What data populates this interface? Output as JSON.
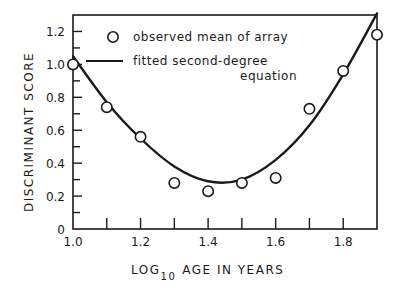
{
  "chart_data": {
    "type": "scatter",
    "title": "",
    "xlabel": "LOG10 AGE IN YEARS",
    "xlabel_parts": {
      "prefix": "LOG",
      "subscript": "10",
      "suffix": "AGE IN YEARS"
    },
    "ylabel": "DISCRIMINANT SCORE",
    "xlim": [
      1.0,
      1.9
    ],
    "ylim": [
      0,
      1.3
    ],
    "x_ticks": [
      1.0,
      1.1,
      1.2,
      1.3,
      1.4,
      1.5,
      1.6,
      1.7,
      1.8
    ],
    "x_tick_labels": [
      "1.0",
      "",
      "1.2",
      "",
      "1.4",
      "",
      "1.6",
      "",
      "1.8"
    ],
    "y_ticks": [
      0,
      0.1,
      0.2,
      0.3,
      0.4,
      0.5,
      0.6,
      0.7,
      0.8,
      0.9,
      1.0,
      1.1,
      1.2
    ],
    "y_tick_labels": [
      "0",
      "",
      "0.2",
      "",
      "0.4",
      "",
      "0.6",
      "",
      "0.8",
      "",
      "1.0",
      "",
      "1.2"
    ],
    "grid": false,
    "legend_position": "upper-left-inside",
    "series": [
      {
        "name": "observed mean of array",
        "kind": "scatter",
        "marker": "open-circle",
        "x": [
          1.0,
          1.1,
          1.2,
          1.3,
          1.4,
          1.5,
          1.6,
          1.7,
          1.8,
          1.9
        ],
        "y": [
          1.0,
          0.74,
          0.56,
          0.28,
          0.23,
          0.28,
          0.31,
          0.73,
          0.96,
          1.18
        ]
      },
      {
        "name": "fitted second-degree equation",
        "kind": "line",
        "x": [
          1.0,
          1.1,
          1.2,
          1.3,
          1.4,
          1.5,
          1.6,
          1.7,
          1.8,
          1.9
        ],
        "y": [
          1.05,
          0.77,
          0.55,
          0.38,
          0.29,
          0.3,
          0.42,
          0.63,
          0.94,
          1.31
        ]
      }
    ]
  },
  "legend": {
    "items": [
      {
        "label": "observed mean of array"
      },
      {
        "label_line1": "fitted second-degree",
        "label_line2": "equation"
      }
    ]
  },
  "style": {
    "ink": "#1a1a1a",
    "background": "#ffffff"
  }
}
